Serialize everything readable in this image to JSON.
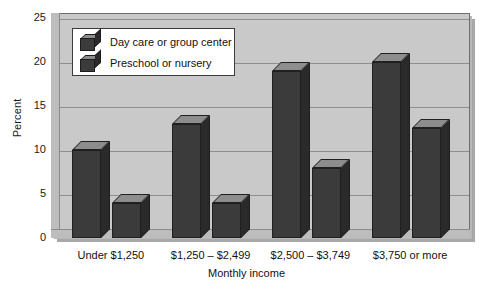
{
  "chart_data": {
    "type": "bar",
    "title": "",
    "xlabel": "Monthly income",
    "ylabel": "Percent",
    "categories": [
      "Under $1,250",
      "$1,250 – $2,499",
      "$2,500 – $3,749",
      "$3,750 or more"
    ],
    "series": [
      {
        "name": "Day care or group center",
        "values": [
          10,
          13,
          19,
          20
        ]
      },
      {
        "name": "Preschool or nursery",
        "values": [
          4,
          4,
          8,
          12.5
        ]
      }
    ],
    "ylim": [
      0,
      25
    ],
    "yticks": [
      0,
      5,
      10,
      15,
      20,
      25
    ],
    "ytick_labels": [
      "0",
      "5",
      "10",
      "15",
      "20",
      "25"
    ],
    "grid": true,
    "legend_position": "top-left",
    "style": "3d-bar",
    "colors": {
      "bar_front": "#3b3b3b",
      "bar_top": "#8d8d8d",
      "bar_side": "#2a2a2a",
      "plot_background": "#c9c9c9",
      "gridline": "#8e8e8e",
      "legend_background": "#ffffff",
      "text": "#111111"
    }
  },
  "legend": {
    "items": [
      {
        "label": "Day care or group center",
        "icon": "cube-icon"
      },
      {
        "label": "Preschool or nursery",
        "icon": "cube-icon"
      }
    ]
  },
  "axes": {
    "y_title": "Percent",
    "x_title": "Monthly income"
  }
}
